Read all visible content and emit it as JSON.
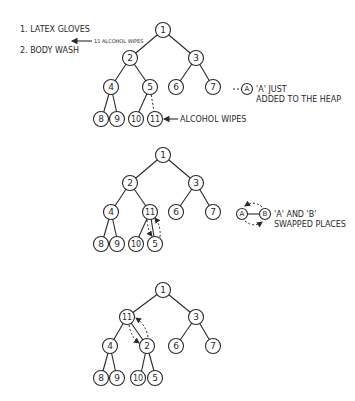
{
  "list": {
    "items": [
      "1. LATEX GLOVES",
      "2. BODY WASH"
    ],
    "insert_note": "11 ALCOHOL WIPES"
  },
  "trees": [
    {
      "nodes": [
        "1",
        "2",
        "3",
        "4",
        "5",
        "6",
        "7",
        "8",
        "9",
        "10",
        "11"
      ],
      "arrow_label": "ALCOHOL WIPES",
      "legend_node": "A",
      "legend_line1": "'A' JUST",
      "legend_line2": "ADDED TO THE HEAP"
    },
    {
      "nodes": [
        "1",
        "2",
        "3",
        "4",
        "11",
        "6",
        "7",
        "8",
        "9",
        "10",
        "5"
      ],
      "legend_node_a": "A",
      "legend_node_b": "B",
      "legend_line1": "'A' AND 'B'",
      "legend_line2": "SWAPPED PLACES"
    },
    {
      "nodes": [
        "1",
        "11",
        "3",
        "4",
        "2",
        "6",
        "7",
        "8",
        "9",
        "10",
        "5"
      ]
    }
  ],
  "colors": {
    "ink": "#2a2a2a",
    "background": "#ffffff"
  }
}
